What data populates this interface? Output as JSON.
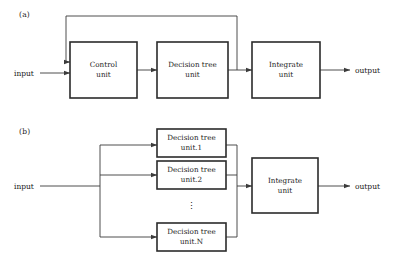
{
  "figure": {
    "width": 395,
    "height": 261,
    "background": "#ffffff",
    "line_color": "#3b3b3b",
    "box_border_color": "#2b2b2b",
    "text_color": "#1a1a1a"
  },
  "panels": [
    {
      "id": "a",
      "label": "(a)",
      "input_label": "input",
      "output_label": "output",
      "boxes": [
        {
          "id": "control-unit",
          "line1": "Control",
          "line2": "unit"
        },
        {
          "id": "decision-tree-unit",
          "line1": "Decision tree",
          "line2": "unit"
        },
        {
          "id": "integrate-unit",
          "line1": "Integrate",
          "line2": "unit"
        }
      ],
      "feedback": "decision-tree-unit-to-control-unit"
    },
    {
      "id": "b",
      "label": "(b)",
      "input_label": "input",
      "output_label": "output",
      "ellipsis": "⋮",
      "boxes": [
        {
          "id": "decision-tree-unit-1",
          "line1": "Decision tree",
          "line2": "unit.1"
        },
        {
          "id": "decision-tree-unit-2",
          "line1": "Decision tree",
          "line2": "unit.2"
        },
        {
          "id": "decision-tree-unit-n",
          "line1": "Decision tree",
          "line2": "unit.N"
        },
        {
          "id": "integrate-unit",
          "line1": "Integrate",
          "line2": "unit"
        }
      ]
    }
  ]
}
